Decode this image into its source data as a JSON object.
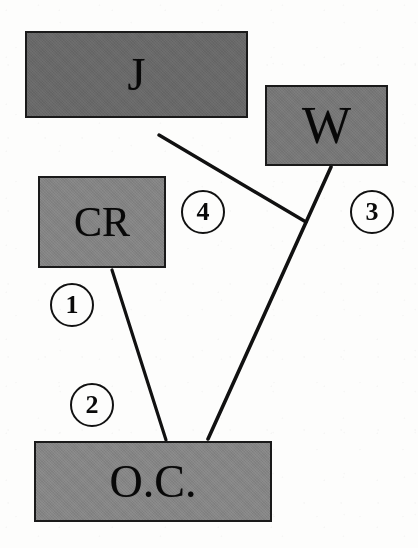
{
  "figure": {
    "type": "node-link-diagram",
    "background_color": "#fdfdfc",
    "ink_color": "#111111"
  },
  "nodes": [
    {
      "id": "j",
      "label": "J",
      "fill": "#6e6e6e",
      "x": 25,
      "y": 31,
      "width": 223,
      "height": 87
    },
    {
      "id": "w",
      "label": "W",
      "fill": "#7d7d7d",
      "x": 265,
      "y": 85,
      "width": 123,
      "height": 81
    },
    {
      "id": "cr",
      "label": "CR",
      "fill": "#8a8a8a",
      "x": 38,
      "y": 176,
      "width": 128,
      "height": 92
    },
    {
      "id": "oc",
      "label": "O.C.",
      "fill": "#8c8c8c",
      "x": 34,
      "y": 441,
      "width": 238,
      "height": 81
    }
  ],
  "edges": [
    {
      "id": "edge-1",
      "badge": "1",
      "from": "cr",
      "to": "oc",
      "x1": 112,
      "y1": 270,
      "x2": 166,
      "y2": 440,
      "badge_x": 50,
      "badge_y": 283
    },
    {
      "id": "edge-2",
      "badge": "2",
      "from": "cr",
      "to": "oc",
      "badge_x": 70,
      "badge_y": 383
    },
    {
      "id": "edge-3",
      "badge": "3",
      "from": "w",
      "to": "oc",
      "x1": 331,
      "y1": 167,
      "x2": 208,
      "y2": 439,
      "badge_x": 350,
      "badge_y": 190
    },
    {
      "id": "edge-4",
      "badge": "4",
      "from": "j",
      "to": "w",
      "x1": 159,
      "y1": 135,
      "x2": 306,
      "y2": 222,
      "badge_x": 181,
      "badge_y": 190
    }
  ]
}
